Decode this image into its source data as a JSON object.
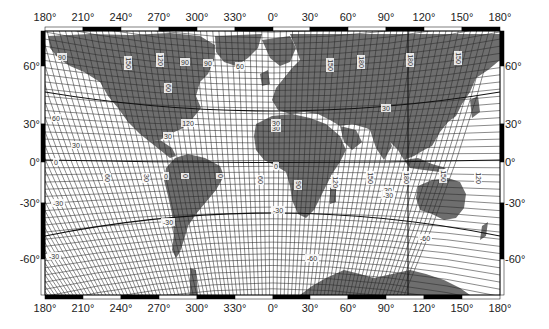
{
  "map": {
    "title": "",
    "projection": "oblique-world graticule",
    "frame": {
      "left": 45,
      "right": 500,
      "top": 31,
      "bottom": 295
    },
    "colors": {
      "land": "#6e6e6e",
      "ocean": "#ffffff",
      "grid": "#2a2a2a",
      "frame": "#000000"
    },
    "lon_ticks": [
      {
        "label": "180°",
        "x": 45
      },
      {
        "label": "210°",
        "x": 83
      },
      {
        "label": "240°",
        "x": 121
      },
      {
        "label": "270°",
        "x": 159
      },
      {
        "label": "300°",
        "x": 197
      },
      {
        "label": "330°",
        "x": 235
      },
      {
        "label": "0°",
        "x": 273
      },
      {
        "label": "30°",
        "x": 310
      },
      {
        "label": "60°",
        "x": 348
      },
      {
        "label": "90°",
        "x": 386
      },
      {
        "label": "120°",
        "x": 424
      },
      {
        "label": "150°",
        "x": 462
      },
      {
        "label": "180°",
        "x": 500
      }
    ],
    "lat_ticks": [
      {
        "label": "60°",
        "y": 66
      },
      {
        "label": "30°",
        "y": 124
      },
      {
        "label": "0°",
        "y": 162
      },
      {
        "label": "-30°",
        "y": 203
      },
      {
        "label": "-60°",
        "y": 259
      }
    ],
    "grid_labels": [
      {
        "text": "90",
        "x": 62,
        "y": 57,
        "rot": 0
      },
      {
        "text": "150",
        "x": 128,
        "y": 63,
        "rot": 90
      },
      {
        "text": "120",
        "x": 160,
        "y": 60,
        "rot": 90
      },
      {
        "text": "90",
        "x": 185,
        "y": 62,
        "rot": 0
      },
      {
        "text": "90",
        "x": 208,
        "y": 63,
        "rot": 0
      },
      {
        "text": "60",
        "x": 240,
        "y": 66,
        "rot": 0
      },
      {
        "text": "150",
        "x": 330,
        "y": 65,
        "rot": 90
      },
      {
        "text": "180",
        "x": 361,
        "y": 62,
        "rot": 90
      },
      {
        "text": "180",
        "x": 410,
        "y": 60,
        "rot": 90
      },
      {
        "text": "150",
        "x": 458,
        "y": 58,
        "rot": 90
      },
      {
        "text": "60",
        "x": 168,
        "y": 88,
        "rot": 90
      },
      {
        "text": "120",
        "x": 188,
        "y": 123,
        "rot": 0
      },
      {
        "text": "60",
        "x": 56,
        "y": 118,
        "rot": 0
      },
      {
        "text": "30",
        "x": 76,
        "y": 145,
        "rot": 0
      },
      {
        "text": "30",
        "x": 168,
        "y": 136,
        "rot": 0
      },
      {
        "text": "30",
        "x": 276,
        "y": 128,
        "rot": 0
      },
      {
        "text": "30",
        "x": 386,
        "y": 108,
        "rot": 0
      },
      {
        "text": "30",
        "x": 276,
        "y": 123,
        "rot": 0
      },
      {
        "text": "0",
        "x": 56,
        "y": 162,
        "rot": 0
      },
      {
        "text": "60",
        "x": 107,
        "y": 178,
        "rot": 90
      },
      {
        "text": "30",
        "x": 146,
        "y": 178,
        "rot": 90
      },
      {
        "text": "0",
        "x": 166,
        "y": 176,
        "rot": 0
      },
      {
        "text": "0",
        "x": 185,
        "y": 176,
        "rot": 90
      },
      {
        "text": "0",
        "x": 220,
        "y": 176,
        "rot": 90
      },
      {
        "text": "60",
        "x": 260,
        "y": 180,
        "rot": 90
      },
      {
        "text": "0",
        "x": 276,
        "y": 166,
        "rot": 0
      },
      {
        "text": "90",
        "x": 298,
        "y": 185,
        "rot": 90
      },
      {
        "text": "120",
        "x": 335,
        "y": 182,
        "rot": 90
      },
      {
        "text": "150",
        "x": 370,
        "y": 178,
        "rot": 90
      },
      {
        "text": "180",
        "x": 406,
        "y": 178,
        "rot": 90
      },
      {
        "text": "30",
        "x": 388,
        "y": 190,
        "rot": 0
      },
      {
        "text": "150",
        "x": 443,
        "y": 176,
        "rot": 90
      },
      {
        "text": "120",
        "x": 478,
        "y": 178,
        "rot": 90
      },
      {
        "text": "-30",
        "x": 58,
        "y": 203,
        "rot": 0
      },
      {
        "text": "-30",
        "x": 168,
        "y": 222,
        "rot": 0
      },
      {
        "text": "-30",
        "x": 278,
        "y": 210,
        "rot": 0
      },
      {
        "text": "-30",
        "x": 388,
        "y": 195,
        "rot": 0
      },
      {
        "text": "-60",
        "x": 425,
        "y": 238,
        "rot": 0
      },
      {
        "text": "-30",
        "x": 54,
        "y": 256,
        "rot": 0
      },
      {
        "text": "-60",
        "x": 312,
        "y": 258,
        "rot": 0
      }
    ]
  }
}
